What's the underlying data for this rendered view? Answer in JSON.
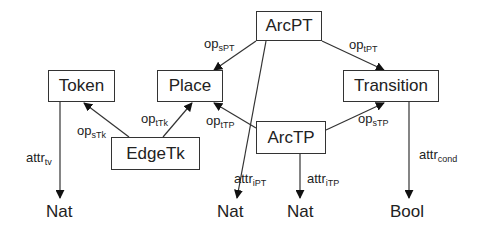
{
  "diagram": {
    "type": "type-graph",
    "nodes": [
      {
        "id": "ArcPT",
        "label": "ArcPT"
      },
      {
        "id": "Token",
        "label": "Token"
      },
      {
        "id": "Place",
        "label": "Place"
      },
      {
        "id": "Transition",
        "label": "Transition"
      },
      {
        "id": "EdgeTk",
        "label": "EdgeTk"
      },
      {
        "id": "ArcTP",
        "label": "ArcTP"
      }
    ],
    "sorts": [
      {
        "id": "nat1",
        "label": "Nat"
      },
      {
        "id": "nat2",
        "label": "Nat"
      },
      {
        "id": "nat3",
        "label": "Nat"
      },
      {
        "id": "bool",
        "label": "Bool"
      }
    ],
    "edges": [
      {
        "from": "ArcPT",
        "to": "Place",
        "base": "op",
        "sub": "sPT"
      },
      {
        "from": "ArcPT",
        "to": "Transition",
        "base": "op",
        "sub": "tPT"
      },
      {
        "from": "EdgeTk",
        "to": "Token",
        "base": "op",
        "sub": "sTk"
      },
      {
        "from": "EdgeTk",
        "to": "Place",
        "base": "op",
        "sub": "tTk"
      },
      {
        "from": "ArcTP",
        "to": "Place",
        "base": "op",
        "sub": "tTP"
      },
      {
        "from": "ArcTP",
        "to": "Transition",
        "base": "op",
        "sub": "sTP"
      },
      {
        "from": "Token",
        "to": "nat1",
        "base": "attr",
        "sub": "tv"
      },
      {
        "from": "ArcPT",
        "to": "nat2",
        "base": "attr",
        "sub": "iPT"
      },
      {
        "from": "ArcTP",
        "to": "nat3",
        "base": "attr",
        "sub": "iTP"
      },
      {
        "from": "Transition",
        "to": "bool",
        "base": "attr",
        "sub": "cond"
      }
    ]
  }
}
